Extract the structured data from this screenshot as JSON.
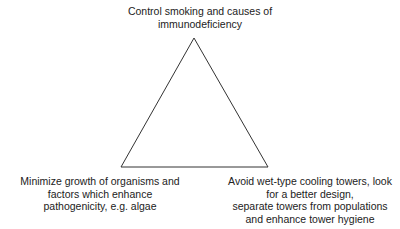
{
  "diagram": {
    "type": "triangle",
    "colors": {
      "line": "#333333",
      "text": "#222222",
      "background": "#ffffff"
    },
    "vertices": {
      "top": {
        "lines": [
          "Control smoking and causes of",
          "immunodeficiency"
        ]
      },
      "bottom_left": {
        "lines": [
          "Minimize growth of organisms and",
          "factors which enhance",
          "pathogenicity, e.g. algae"
        ]
      },
      "bottom_right": {
        "lines": [
          "Avoid wet-type cooling towers, look",
          "for a better design,",
          "separate towers from populations",
          "and enhance tower hygiene"
        ]
      }
    }
  }
}
